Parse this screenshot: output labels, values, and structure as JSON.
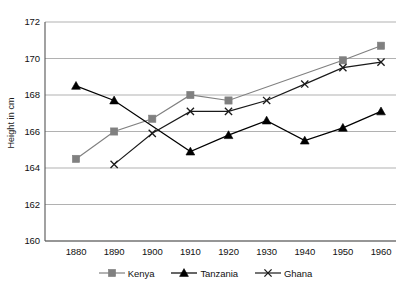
{
  "chart_data": {
    "type": "line",
    "title": "",
    "xlabel": "",
    "ylabel": "Height in cm",
    "categories": [
      "1880",
      "1890",
      "1900",
      "1910",
      "1920",
      "1930",
      "1940",
      "1950",
      "1960"
    ],
    "x": [
      1880,
      1890,
      1900,
      1910,
      1920,
      1930,
      1940,
      1950,
      1960
    ],
    "xlim": [
      1875,
      1965
    ],
    "ylim": [
      160,
      172
    ],
    "yticks": [
      "160",
      "162",
      "164",
      "166",
      "168",
      "170",
      "172"
    ],
    "ytick_values": [
      160,
      162,
      164,
      166,
      168,
      170,
      172
    ],
    "grid": "horizontal",
    "legend_position": "bottom",
    "series": [
      {
        "name": "Kenya",
        "marker": "square",
        "color": "#808080",
        "values": [
          164.5,
          166.0,
          166.7,
          168.0,
          167.7,
          null,
          null,
          169.9,
          170.7
        ]
      },
      {
        "name": "Tanzania",
        "marker": "triangle",
        "color": "#000000",
        "values": [
          168.5,
          167.7,
          null,
          164.9,
          165.8,
          166.6,
          165.5,
          166.2,
          167.1
        ]
      },
      {
        "name": "Ghana",
        "marker": "cross",
        "color": "#1a1a1a",
        "values": [
          null,
          164.2,
          165.9,
          167.1,
          167.1,
          167.7,
          168.6,
          169.5,
          169.8
        ]
      }
    ]
  },
  "axis": {
    "y_title": "Height in cm"
  },
  "legend": {
    "items": [
      {
        "label": "Kenya",
        "marker": "square-marker",
        "color": "#808080"
      },
      {
        "label": "Tanzania",
        "marker": "triangle-marker",
        "color": "#000000"
      },
      {
        "label": "Ghana",
        "marker": "cross-marker",
        "color": "#1a1a1a"
      }
    ]
  },
  "colors": {
    "kenya": "#808080",
    "tanzania": "#000000",
    "ghana": "#1a1a1a",
    "grid": "#a8a8a8",
    "axis": "#555555",
    "background": "#ffffff"
  }
}
